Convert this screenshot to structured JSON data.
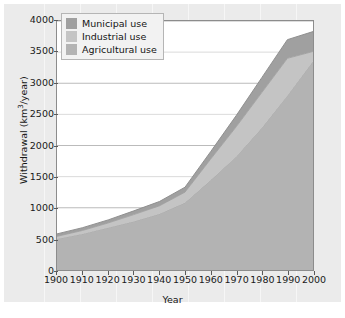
{
  "chart_data": {
    "type": "area",
    "stacked": true,
    "title": "",
    "xlabel": "Year",
    "ylabel": "Withdrawal (km3/year)",
    "ylabel_display": "Withdrawal (km³/year)",
    "ylabel_unit_base": "Withdrawal (km",
    "ylabel_unit_sup": "3",
    "ylabel_unit_tail": "/year)",
    "xlim": [
      1900,
      2000
    ],
    "ylim": [
      0,
      4000
    ],
    "grid": true,
    "grid_axis": "y",
    "legend_position": "top-left",
    "x": [
      1900,
      1910,
      1920,
      1930,
      1940,
      1950,
      1960,
      1970,
      1980,
      1990,
      2000
    ],
    "xticks": [
      "1900",
      "1910",
      "1920",
      "1930",
      "1940",
      "1950",
      "1960",
      "1970",
      "1980",
      "1990",
      "2000"
    ],
    "yticks": [
      "0",
      "500",
      "1000",
      "1500",
      "2000",
      "2500",
      "3000",
      "3500",
      "4000"
    ],
    "ytick_values": [
      0,
      500,
      1000,
      1500,
      2000,
      2500,
      3000,
      3500,
      4000
    ],
    "series": [
      {
        "name": "Agricultural use",
        "color": "#b3b3b3",
        "values": [
          500,
          580,
          680,
          780,
          900,
          1080,
          1440,
          1820,
          2280,
          2800,
          3350
        ]
      },
      {
        "name": "Industrial use",
        "color": "#c4c4c4",
        "values": [
          40,
          55,
          75,
          110,
          130,
          170,
          340,
          480,
          570,
          600,
          160
        ]
      },
      {
        "name": "Municipal use",
        "color": "#a0a0a0",
        "values": [
          40,
          45,
          50,
          60,
          70,
          80,
          120,
          180,
          240,
          300,
          320
        ]
      }
    ],
    "totals": [
      580,
      680,
      805,
      950,
      1100,
      1330,
      1900,
      2480,
      3090,
      3700,
      3830
    ]
  },
  "legend": {
    "items": [
      {
        "label": "Municipal use",
        "color": "#a0a0a0"
      },
      {
        "label": "Industrial use",
        "color": "#c4c4c4"
      },
      {
        "label": "Agricultural use",
        "color": "#b3b3b3"
      }
    ]
  },
  "axes": {
    "x_title": "Year",
    "y_title_base": "Withdrawal (km",
    "y_title_sup": "3",
    "y_title_tail": "/year)"
  },
  "colors": {
    "figure_background": "#ebebeb",
    "plot_background": "#ffffff",
    "frame": "#8c8c8c",
    "gridline": "#9a9a9a",
    "text": "#141414",
    "municipal": "#a0a0a0",
    "industrial": "#c4c4c4",
    "agricultural": "#b3b3b3"
  }
}
